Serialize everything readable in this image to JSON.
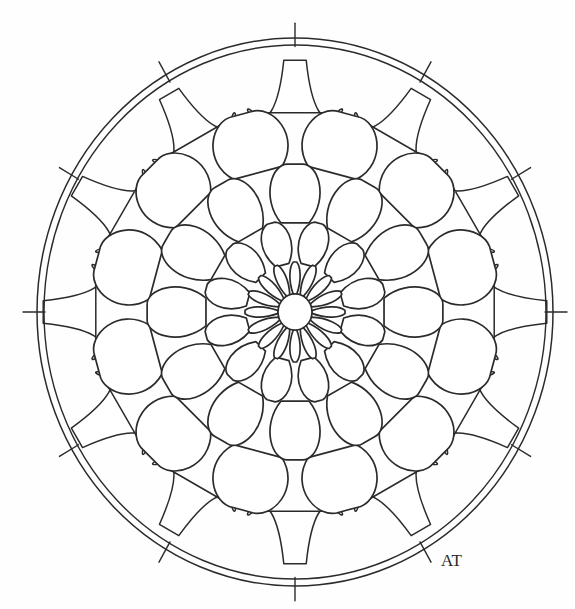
{
  "canvas": {
    "width": 575,
    "height": 609,
    "background_color": "#fefefe",
    "ink_color": "#2b2b2b"
  },
  "artwork": {
    "kind": "mandala-line-art",
    "title": "Mandala Coloring Page",
    "center": {
      "x": 295,
      "y": 312
    },
    "outer_radius_x": 258,
    "outer_radius_y": 274
  },
  "chart_data": {
    "type": "pie",
    "categories": [
      "center-disc",
      "ring-1-inner-slim-petals",
      "ring-2-teardrop-petals",
      "ring-3-round-petals",
      "ring-4-broad-lobes",
      "ring-5-outer-cells",
      "outer-double-circle"
    ],
    "values": [
      1,
      16,
      12,
      12,
      12,
      12,
      2
    ],
    "xlabel": "ring",
    "ylabel": "segment count"
  },
  "mandala": {
    "center_disc": {
      "name": "center-disc",
      "radius": 17,
      "stroke_width": 1.7
    },
    "rings": [
      {
        "id": "ring-1",
        "label": "inner slim petals",
        "count": 16,
        "phase_deg": 0,
        "inner_radius": 17,
        "outer_radius": 50,
        "waist": 0.4,
        "tip_round": 0.92,
        "stroke_width": 1.7,
        "shape": "slim-teardrop"
      },
      {
        "id": "ring-2",
        "label": "teardrop petals",
        "count": 12,
        "phase_deg": 15,
        "inner_radius": 49,
        "outer_radius": 92,
        "waist": 0.5,
        "tip_round": 0.98,
        "stroke_width": 1.7,
        "shape": "teardrop"
      },
      {
        "id": "ring-3",
        "label": "round petals",
        "count": 12,
        "phase_deg": 0,
        "inner_radius": 90,
        "outer_radius": 148,
        "waist": 0.56,
        "tip_round": 1.02,
        "stroke_width": 1.7,
        "shape": "teardrop"
      },
      {
        "id": "ring-4",
        "label": "broad lobes",
        "count": 12,
        "phase_deg": 15,
        "inner_radius": 146,
        "outer_radius": 205,
        "waist": 0.62,
        "tip_round": 1.02,
        "stroke_width": 1.7,
        "shape": "teardrop"
      },
      {
        "id": "ring-5",
        "label": "outer cells",
        "count": 12,
        "phase_deg": 0,
        "inner_radius": 203,
        "outer_radius": 252,
        "waist": 0.74,
        "tip_round": 0.58,
        "stroke_width": 1.5,
        "shape": "polygon-cell"
      }
    ],
    "outer_circles": [
      {
        "name": "outer-circle-outer",
        "rx": 258,
        "ry": 274,
        "stroke_width": 1.5
      },
      {
        "name": "outer-circle-inner",
        "rx": 251,
        "ry": 267,
        "stroke_width": 1.4
      }
    ],
    "outer_spokes": {
      "name": "outer-spokes",
      "count": 12,
      "phase_deg": 0,
      "from_radius": 250,
      "to_radius": 272,
      "stroke_width": 1.4
    }
  },
  "signature": {
    "name": "artist-signature",
    "text": "AT",
    "x": 441,
    "y": 566,
    "description": "joined AT monogram"
  }
}
